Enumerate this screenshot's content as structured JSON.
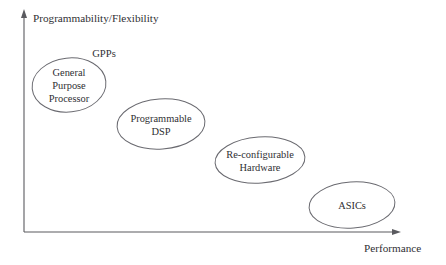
{
  "figure": {
    "background_color": "#ffffff",
    "line_color": "#5a5a5f",
    "ellipse_stroke_color": "#6a6a70",
    "text_color": "#2f2f33"
  },
  "axes": {
    "y": {
      "label": "Programmability/Flexibility",
      "label_x": 33,
      "label_y": 22,
      "x": 24,
      "top_y": 10,
      "bottom_y": 232,
      "arrow": "up-arrow-icon"
    },
    "x": {
      "label": "Performance",
      "label_x": 364,
      "label_y": 252,
      "y": 232,
      "left_x": 24,
      "right_x": 401,
      "arrow": "right-arrow-icon"
    }
  },
  "annotations": [
    {
      "name": "gpps-label",
      "text": "GPPs",
      "cx": 104,
      "cy": 57
    }
  ],
  "nodes": [
    {
      "name": "general-purpose-processor",
      "lines": [
        "General",
        "Purpose",
        "Processor"
      ],
      "cx": 69,
      "cy": 85,
      "rx": 37,
      "ry": 27,
      "rotation": -6
    },
    {
      "name": "programmable-dsp",
      "lines": [
        "Programmable",
        "DSP"
      ],
      "cx": 161,
      "cy": 124,
      "rx": 44,
      "ry": 25,
      "rotation": -4
    },
    {
      "name": "re-configurable-hardware",
      "lines": [
        "Re-configurable",
        "Hardware"
      ],
      "cx": 260,
      "cy": 160,
      "rx": 45,
      "ry": 23,
      "rotation": -4
    },
    {
      "name": "asics",
      "lines": [
        "ASICs"
      ],
      "cx": 352,
      "cy": 205,
      "rx": 43,
      "ry": 23,
      "rotation": -4
    }
  ]
}
